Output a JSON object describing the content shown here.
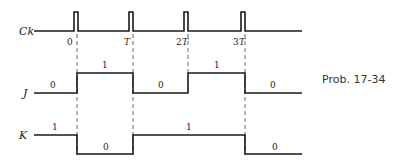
{
  "caption": "Prob. 17-34",
  "signals": {
    "ck": {
      "label": "Ck"
    },
    "j": {
      "label": "J",
      "levels": [
        "0",
        "1",
        "0",
        "1",
        "0"
      ]
    },
    "k": {
      "label": "K",
      "levels": [
        "1",
        "0",
        "1",
        "0"
      ]
    }
  },
  "time_ticks": [
    {
      "num": "0",
      "sym": ""
    },
    {
      "num": "",
      "sym": "T"
    },
    {
      "num": "2",
      "sym": "T"
    },
    {
      "num": "3",
      "sym": "T"
    }
  ]
}
